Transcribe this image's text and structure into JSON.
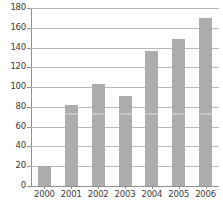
{
  "chart_data": {
    "type": "bar",
    "title": "",
    "subtitle": "",
    "xlabel": "",
    "ylabel": "",
    "categories": [
      "2000",
      "2001",
      "2002",
      "2003",
      "2004",
      "2005",
      "2006"
    ],
    "values": [
      20,
      82,
      103,
      91,
      137,
      149,
      170
    ],
    "ylim": [
      0,
      180
    ],
    "ytick_step": 20,
    "yticks": [
      "0",
      "20",
      "40",
      "60",
      "80",
      "100",
      "120",
      "140",
      "160",
      "180"
    ],
    "grid": true,
    "legend": false,
    "legend_position": "none",
    "series": [
      {
        "name": "",
        "values": [
          20,
          82,
          103,
          91,
          137,
          149,
          170
        ]
      }
    ],
    "colors": {
      "bar": "#adadad",
      "gridline": "#b9b9b9",
      "axis": "#8f8f8f",
      "text": "#3a3a3a",
      "background": "#ffffff"
    }
  }
}
